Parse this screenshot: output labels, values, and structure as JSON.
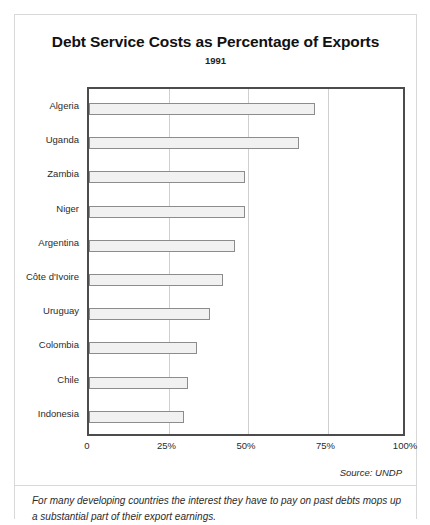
{
  "chart_data": {
    "type": "bar",
    "orientation": "horizontal",
    "title": "Debt Service Costs as Percentage of Exports",
    "subtitle": "1991",
    "xlabel": "",
    "ylabel": "",
    "xlim": [
      0,
      100
    ],
    "grid": true,
    "legend": null,
    "tick_labels": [
      "0",
      "25%",
      "50%",
      "75%",
      "100%"
    ],
    "tick_values": [
      0,
      25,
      50,
      75,
      100
    ],
    "categories": [
      "Algeria",
      "Uganda",
      "Zambia",
      "Niger",
      "Argentina",
      "Côte d'Ivoire",
      "Uruguay",
      "Colombia",
      "Chile",
      "Indonesia"
    ],
    "values": [
      71,
      66,
      49,
      49,
      46,
      42,
      38,
      34,
      31,
      30
    ],
    "colors": {
      "bar_fill": "#f1f1f1",
      "bar_border": "#8c8c8c",
      "axis": "#4c4c4c",
      "gridline": "#cfcfcf"
    }
  },
  "source": "Source:  UNDP",
  "caption": "For many developing countries the interest they have to pay on past debts mops up a substantial part of their export earnings."
}
